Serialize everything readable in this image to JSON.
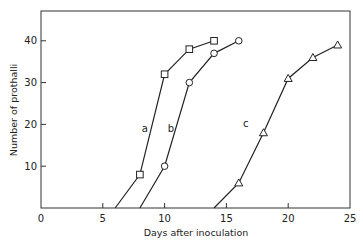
{
  "chart_data": {
    "type": "line",
    "title": "",
    "xlabel": "Days after inoculation",
    "ylabel": "Number of prothalli",
    "xlim": [
      0,
      25
    ],
    "ylim": [
      0,
      45
    ],
    "xticks": [
      0,
      5,
      10,
      15,
      20,
      25
    ],
    "yticks": [
      10,
      20,
      30,
      40
    ],
    "grid": false,
    "legend": "inline curve labels",
    "series": [
      {
        "name": "a",
        "marker": "square",
        "x": [
          6,
          8,
          10,
          12,
          14
        ],
        "y": [
          0,
          8,
          32,
          38,
          40
        ],
        "label_at": [
          8.8,
          19
        ]
      },
      {
        "name": "b",
        "marker": "circle",
        "x": [
          8,
          10,
          12,
          14,
          16
        ],
        "y": [
          0,
          10,
          30,
          37,
          40
        ],
        "label_at": [
          10.9,
          19
        ]
      },
      {
        "name": "c",
        "marker": "triangle",
        "x": [
          14,
          16,
          18,
          20,
          22,
          24
        ],
        "y": [
          0,
          6,
          18,
          31,
          36,
          39
        ],
        "label_at": [
          17.0,
          20
        ]
      }
    ]
  }
}
